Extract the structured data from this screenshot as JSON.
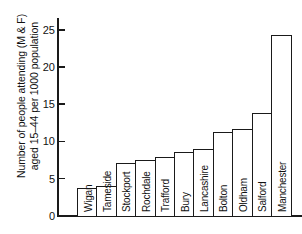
{
  "chart_data": {
    "type": "bar",
    "title": "",
    "subtitle": "",
    "xlabel": "",
    "ylabel_line1": "Number of people attending (M & F)",
    "ylabel_line2": "aged 15–44 per 1000 population",
    "ylim": [
      0,
      26.5
    ],
    "yticks": [
      0,
      5,
      10,
      15,
      20,
      25
    ],
    "ytick_labels": [
      "0",
      "5",
      "10",
      "15",
      "20",
      "25"
    ],
    "grid": false,
    "legend": false,
    "orientation": "vertical",
    "bar_label_rotation": -90,
    "categories": [
      "Wigan",
      "Tameside",
      "Stockport",
      "Rochdale",
      "Trafford",
      "Bury",
      "Lancashire",
      "Bolton",
      "Oldham",
      "Salford",
      "Manchester"
    ],
    "values": [
      3.8,
      4.1,
      7.1,
      7.5,
      8.0,
      8.6,
      9.0,
      11.3,
      11.7,
      13.9,
      24.4
    ],
    "bars": [
      {
        "label": "Wigan",
        "value": 3.8
      },
      {
        "label": "Tameside",
        "value": 4.1
      },
      {
        "label": "Stockport",
        "value": 7.1
      },
      {
        "label": "Rochdale",
        "value": 7.5
      },
      {
        "label": "Trafford",
        "value": 8.0
      },
      {
        "label": "Bury",
        "value": 8.6
      },
      {
        "label": "Lancashire",
        "value": 9.0
      },
      {
        "label": "Bolton",
        "value": 11.3
      },
      {
        "label": "Oldham",
        "value": 11.7
      },
      {
        "label": "Salford",
        "value": 13.9
      },
      {
        "label": "Manchester",
        "value": 24.4
      }
    ],
    "colors": {
      "bar_fill": "#ffffff",
      "bar_stroke": "#1a1a1a",
      "axis": "#1a1a1a",
      "text": "#121212",
      "background": "#ffffff"
    }
  }
}
